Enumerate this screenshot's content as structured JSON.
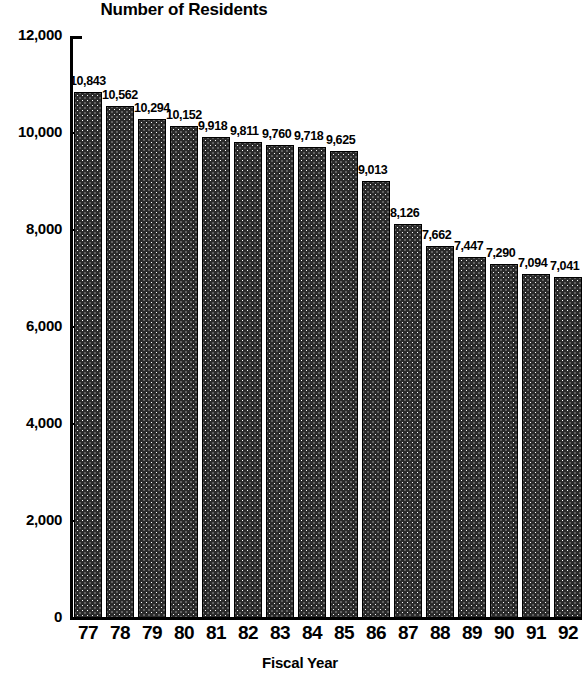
{
  "chart_data": {
    "type": "bar",
    "title": "Number of Residents",
    "xlabel": "Fiscal Year",
    "ylabel": "",
    "categories": [
      "77",
      "78",
      "79",
      "80",
      "81",
      "82",
      "83",
      "84",
      "85",
      "86",
      "87",
      "88",
      "89",
      "90",
      "91",
      "92"
    ],
    "values": [
      10843,
      10562,
      10294,
      10152,
      9918,
      9811,
      9760,
      9718,
      9625,
      9013,
      8126,
      7662,
      7447,
      7290,
      7094,
      7041
    ],
    "data_labels": [
      "10,843",
      "10,562",
      "10,294",
      "10,152",
      "9,918",
      "9,811",
      "9,760",
      "9,718",
      "9,625",
      "9,013",
      "8,126",
      "7,662",
      "7,447",
      "7,290",
      "7,094",
      "7,041"
    ],
    "ylim": [
      0,
      12000
    ],
    "ytick_values": [
      0,
      2000,
      4000,
      6000,
      8000,
      10000,
      12000
    ],
    "ytick_labels": [
      "0",
      "2,000",
      "4,000",
      "6,000",
      "8,000",
      "10,000",
      "12,000"
    ],
    "grid": false,
    "legend": null,
    "bar_color": "#2b2b2b",
    "bar_edge_color": "#000000",
    "axis_color": "#000000",
    "background_color": "#ffffff"
  }
}
